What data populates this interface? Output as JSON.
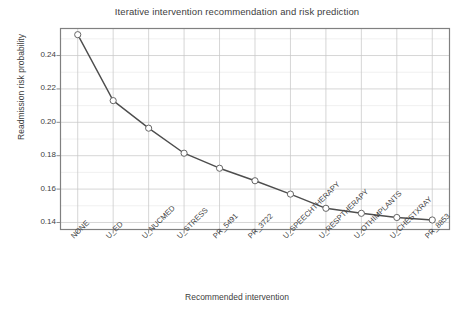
{
  "chart_data": {
    "type": "line",
    "title": "Iterative intervention recommendation and risk prediction",
    "xlabel": "Recommended intervention",
    "ylabel": "Readmission risk probability",
    "categories": [
      "NONE",
      "U_ED",
      "U_NUCMED",
      "U_STRESS",
      "PR_5491",
      "PR_3722",
      "U_SPEECHTHERAPY",
      "U_RESPTHERAPY",
      "U_OTHIMPLANTS",
      "U_CHESTXRAY",
      "PR_8853"
    ],
    "values": [
      0.2525,
      0.213,
      0.1965,
      0.1815,
      0.1725,
      0.165,
      0.157,
      0.1485,
      0.1455,
      0.143,
      0.1415
    ],
    "ylim": [
      0.1355,
      0.2565
    ],
    "yticks": [
      0.14,
      0.16,
      0.18,
      0.2,
      0.22,
      0.24
    ],
    "ytick_labels": [
      "0.14",
      "0.16",
      "0.18",
      "0.20",
      "0.22",
      "0.24"
    ],
    "grid": true,
    "legend": "none",
    "series_name": "Readmission risk probability",
    "line_color": "#4d4d4d",
    "marker": "circle-open",
    "marker_face_color": "#ffffff",
    "marker_edge_color": "#666666",
    "grid_color": "#c8c8c8",
    "axes_color": "#808080",
    "background_color": "#ffffff"
  }
}
